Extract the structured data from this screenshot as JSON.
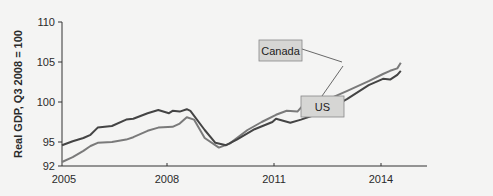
{
  "chart_data": {
    "type": "line",
    "title": "",
    "xlabel": "",
    "ylabel": "Real GDP, Q3 2008 = 100",
    "xlim": [
      2005,
      2015.3
    ],
    "ylim": [
      92,
      110
    ],
    "x_ticks": [
      "2005",
      "2008",
      "2011",
      "2014"
    ],
    "y_ticks": [
      "92",
      "95",
      "100",
      "105",
      "110"
    ],
    "grid": false,
    "legend": "inline-labels",
    "series": [
      {
        "name": "Canada",
        "color": "#7a7a7a",
        "points": [
          [
            2005.0,
            92.5
          ],
          [
            2005.3,
            93.1
          ],
          [
            2005.6,
            93.9
          ],
          [
            2005.8,
            94.5
          ],
          [
            2006.0,
            94.9
          ],
          [
            2006.4,
            95.0
          ],
          [
            2006.8,
            95.3
          ],
          [
            2007.0,
            95.6
          ],
          [
            2007.4,
            96.4
          ],
          [
            2007.7,
            96.8
          ],
          [
            2008.1,
            96.9
          ],
          [
            2008.3,
            97.3
          ],
          [
            2008.5,
            98.1
          ],
          [
            2008.7,
            97.8
          ],
          [
            2009.0,
            95.5
          ],
          [
            2009.4,
            94.3
          ],
          [
            2009.7,
            94.8
          ],
          [
            2010.2,
            96.5
          ],
          [
            2010.6,
            97.5
          ],
          [
            2011.0,
            98.4
          ],
          [
            2011.3,
            98.9
          ],
          [
            2011.6,
            98.8
          ],
          [
            2011.8,
            99.8
          ],
          [
            2012.1,
            100.0
          ],
          [
            2012.6,
            100.6
          ],
          [
            2013.0,
            101.4
          ],
          [
            2013.6,
            102.6
          ],
          [
            2014.0,
            103.5
          ],
          [
            2014.2,
            103.9
          ],
          [
            2014.4,
            104.2
          ],
          [
            2014.5,
            104.9
          ]
        ]
      },
      {
        "name": "US",
        "color": "#444444",
        "points": [
          [
            2005.0,
            94.6
          ],
          [
            2005.3,
            95.1
          ],
          [
            2005.6,
            95.5
          ],
          [
            2005.8,
            95.9
          ],
          [
            2006.0,
            96.8
          ],
          [
            2006.4,
            97.0
          ],
          [
            2006.8,
            97.8
          ],
          [
            2007.0,
            97.9
          ],
          [
            2007.4,
            98.6
          ],
          [
            2007.7,
            99.0
          ],
          [
            2008.0,
            98.6
          ],
          [
            2008.1,
            98.9
          ],
          [
            2008.3,
            98.8
          ],
          [
            2008.5,
            99.1
          ],
          [
            2008.6,
            98.9
          ],
          [
            2009.0,
            96.5
          ],
          [
            2009.3,
            94.9
          ],
          [
            2009.6,
            94.6
          ],
          [
            2009.9,
            95.3
          ],
          [
            2010.4,
            96.6
          ],
          [
            2010.9,
            97.5
          ],
          [
            2011.0,
            97.9
          ],
          [
            2011.4,
            97.4
          ],
          [
            2011.7,
            97.8
          ],
          [
            2012.1,
            98.4
          ],
          [
            2012.6,
            99.4
          ],
          [
            2013.0,
            100.4
          ],
          [
            2013.6,
            102.1
          ],
          [
            2014.0,
            102.9
          ],
          [
            2014.2,
            102.8
          ],
          [
            2014.4,
            103.4
          ],
          [
            2014.5,
            103.9
          ]
        ]
      }
    ],
    "annotations": [
      {
        "text": "Canada",
        "box": true
      },
      {
        "text": "US",
        "box": true
      }
    ]
  },
  "labels": {
    "y_axis_title": "Real GDP, Q3 2008 = 100",
    "y_ticks": [
      "110",
      "105",
      "100",
      "95",
      "92"
    ],
    "x_ticks": [
      "2005",
      "2008",
      "2011",
      "2014"
    ],
    "canada": "Canada",
    "us": "US"
  }
}
